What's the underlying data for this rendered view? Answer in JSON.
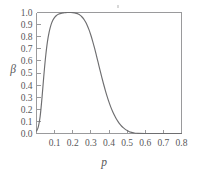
{
  "chart_data": {
    "type": "line",
    "title": "",
    "xlabel": "p",
    "ylabel": "β",
    "xlim": [
      0.0,
      0.8
    ],
    "ylim": [
      0.0,
      1.0
    ],
    "grid": false,
    "legend": null,
    "xticks": [
      0.1,
      0.2,
      0.3,
      0.4,
      0.5,
      0.6,
      0.7,
      0.8
    ],
    "xtick_labels": [
      "0.1",
      "0.2",
      "0.3",
      "0.4",
      "0.5",
      "0.6",
      "0.7",
      "0.8"
    ],
    "yticks": [
      0.0,
      0.1,
      0.2,
      0.3,
      0.4,
      0.5,
      0.6,
      0.7,
      0.8,
      0.9,
      1.0
    ],
    "ytick_labels": [
      "0.0",
      "0.1",
      "0.2",
      "0.3",
      "0.4",
      "0.5",
      "0.6",
      "0.7",
      "0.8",
      "0.9",
      "1.0"
    ],
    "series": [
      {
        "name": "beta",
        "color": "#6e6e70",
        "x": [
          0.0,
          0.01,
          0.02,
          0.03,
          0.04,
          0.05,
          0.06,
          0.07,
          0.08,
          0.09,
          0.1,
          0.11,
          0.12,
          0.13,
          0.14,
          0.15,
          0.16,
          0.17,
          0.18,
          0.19,
          0.2,
          0.21,
          0.22,
          0.23,
          0.24,
          0.25,
          0.26,
          0.27,
          0.28,
          0.29,
          0.3,
          0.31,
          0.32,
          0.33,
          0.34,
          0.35,
          0.36,
          0.37,
          0.38,
          0.39,
          0.4,
          0.41,
          0.42,
          0.43,
          0.44,
          0.45,
          0.46,
          0.47,
          0.48,
          0.49,
          0.5,
          0.51,
          0.52,
          0.53,
          0.54,
          0.55,
          0.56,
          0.6,
          0.65,
          0.7,
          0.75,
          0.8
        ],
        "y": [
          0.02,
          0.055,
          0.14,
          0.29,
          0.47,
          0.63,
          0.755,
          0.84,
          0.898,
          0.936,
          0.96,
          0.975,
          0.985,
          0.991,
          0.995,
          0.997,
          0.999,
          1.0,
          1.0,
          1.0,
          0.999,
          0.997,
          0.993,
          0.987,
          0.978,
          0.965,
          0.947,
          0.923,
          0.893,
          0.856,
          0.812,
          0.762,
          0.707,
          0.648,
          0.587,
          0.526,
          0.466,
          0.409,
          0.355,
          0.305,
          0.259,
          0.218,
          0.182,
          0.15,
          0.122,
          0.098,
          0.077,
          0.06,
          0.046,
          0.034,
          0.025,
          0.017,
          0.011,
          0.007,
          0.004,
          0.002,
          0.001,
          0.0,
          0.0,
          0.0,
          0.0,
          0.0
        ]
      }
    ],
    "annotations": []
  },
  "axes": {
    "y_label": "β",
    "x_label": "p"
  }
}
